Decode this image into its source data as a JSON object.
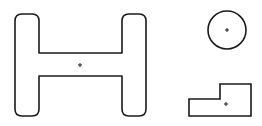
{
  "diagram": {
    "background": "#ffffff",
    "stroke_color": "#1a1a1a",
    "shapes": [
      {
        "name": "h-beam-shape",
        "type": "I-section profile",
        "center_marker": [
          80,
          65
        ]
      },
      {
        "name": "circle-shape",
        "type": "circle",
        "center": [
          227,
          30
        ],
        "radius": 19
      },
      {
        "name": "stepped-block-shape",
        "type": "L-shaped polygon",
        "center_marker": [
          226,
          104
        ]
      }
    ]
  }
}
